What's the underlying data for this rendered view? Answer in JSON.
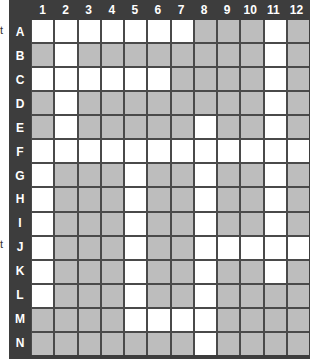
{
  "side_text": [
    {
      "label": "t",
      "near_row": "A"
    },
    {
      "label": "t",
      "near_row": "J"
    }
  ],
  "columns": [
    "1",
    "2",
    "3",
    "4",
    "5",
    "6",
    "7",
    "8",
    "9",
    "10",
    "11",
    "12"
  ],
  "rows": [
    "A",
    "B",
    "C",
    "D",
    "E",
    "F",
    "G",
    "H",
    "I",
    "J",
    "K",
    "L",
    "M",
    "N"
  ],
  "legend": {
    "W": "white (open)",
    "G": "gray (filled)"
  },
  "colors": {
    "frame": "#3d3d3d",
    "gray_cell": "#bdbdbd",
    "white_cell": "#ffffff",
    "header_text": "#ffffff"
  },
  "grid": [
    "WWWWWWWGGGWG",
    "GWGGGGGGGGWG",
    "WWWWWWGGGGWG",
    "GWGGGGGGGGWG",
    "GWGGGGGWGGWG",
    "WWWWWWWWWWWW",
    "WGGGWGGWGGWG",
    "WGGGWGGWGGWG",
    "WGGGWGGWGGWG",
    "WGGGWGGWWWWW",
    "WGGGWGGWGGWG",
    "WGGGWGGWGGGG",
    "GGGGWWWWGGGG",
    "GGGGGGGWGGGG"
  ]
}
